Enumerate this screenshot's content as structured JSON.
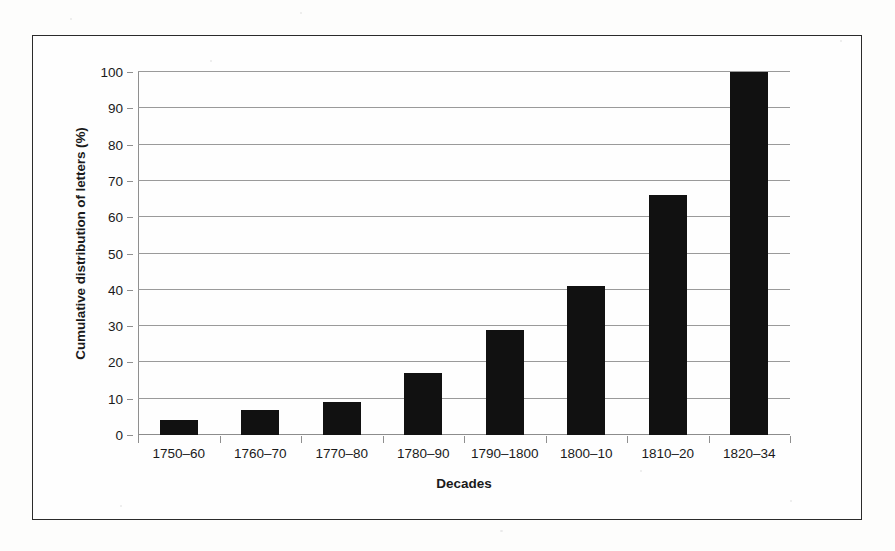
{
  "figure": {
    "frame_border_color": "#2b2b2b",
    "background_color": "#fefefe"
  },
  "chart_data": {
    "type": "bar",
    "title": "",
    "xlabel": "Decades",
    "ylabel": "Cumulative distribution of letters (%)",
    "categories": [
      "1750–60",
      "1760–70",
      "1770–80",
      "1780–90",
      "1790–1800",
      "1800–10",
      "1810–20",
      "1820–34"
    ],
    "values": [
      4,
      7,
      9,
      17,
      29,
      41,
      66,
      100
    ],
    "ylim": [
      0,
      100
    ],
    "ytick_labels": [
      "0",
      "10",
      "20",
      "30",
      "40",
      "50",
      "60",
      "70",
      "80",
      "90",
      "100"
    ],
    "ytick_values": [
      0,
      10,
      20,
      30,
      40,
      50,
      60,
      70,
      80,
      90,
      100
    ],
    "grid": true,
    "grid_axis": "y",
    "legend": false,
    "bar_color": "#111111",
    "gridline_color": "#9a9a9a",
    "axis_color": "#8f8f8f",
    "text_color": "#1a1a1a"
  }
}
